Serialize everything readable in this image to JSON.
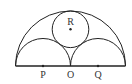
{
  "figure": {
    "points": [
      {
        "id": "P",
        "label": "P"
      },
      {
        "id": "O",
        "label": "O"
      },
      {
        "id": "Q",
        "label": "Q"
      },
      {
        "id": "R",
        "label": "R"
      }
    ],
    "colors": {
      "line": "#222222",
      "text": "#333333",
      "background": "#ffffff"
    }
  }
}
